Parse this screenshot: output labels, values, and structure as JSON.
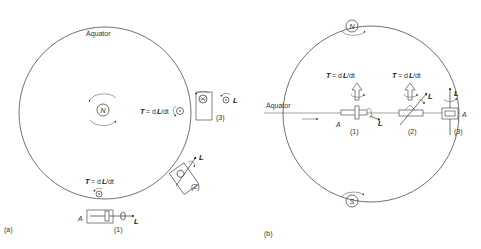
{
  "panel_a": {
    "tag": "(a)",
    "equator_label": "Äquator",
    "pole_label": "N",
    "torque_label_T": "T",
    "torque_label_rest": " = dL/dt",
    "torque_label_side": "T = dL/dt",
    "item_1": "(1)",
    "item_2": "(2)",
    "item_3": "(3)",
    "axis_label_A": "A",
    "vector_L": "L"
  },
  "panel_b": {
    "tag": "(b)",
    "equator_label": "Äquator",
    "pole_north": "N",
    "pole_south": "S",
    "torque_label_1": "T = dL/dt",
    "torque_label_2": "T = dL/dt",
    "item_1": "(1)",
    "item_2": "(2)",
    "item_3": "(3)",
    "axis_label_A": "A",
    "vector_L": "L"
  },
  "colors": {
    "line": "#333333",
    "background": "#ffffff"
  }
}
